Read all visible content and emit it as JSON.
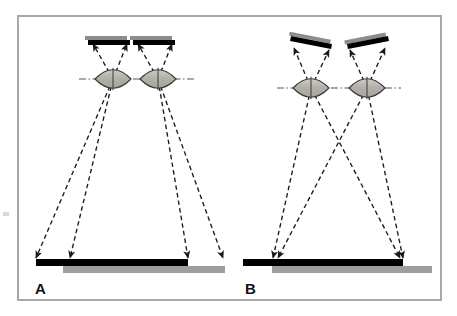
{
  "figure": {
    "background_color": "#ffffff",
    "frame": {
      "name": "figure-border",
      "color": "#a8a8a8",
      "x": 18,
      "y": 16,
      "width": 423,
      "height": 284,
      "stroke_width": 2
    },
    "edge_artifact": {
      "color": "#d9d9d9",
      "x": 3,
      "y": 212,
      "width": 6,
      "height": 4
    }
  },
  "colors": {
    "black": "#000000",
    "sensor_top_gray": "#8c8c8c",
    "object_gray": "#9e9e9e",
    "lens_fill": "#bdbab4",
    "lens_stroke": "#3a3a3a",
    "ray": "#1a1a1a",
    "axis": "#555555",
    "frame": "#a8a8a8"
  },
  "panels": [
    {
      "id": "A",
      "label": "A",
      "label_x": 35,
      "label_y": 294,
      "description": "Parallel (non-converged) sensor configuration with offset object bars",
      "sensors": [
        {
          "name": "sensor-a-left",
          "x1": 88,
          "y1": 40,
          "x2": 130,
          "y2": 40,
          "gray_offset_x": -3,
          "gray_offset_y": -4,
          "thickness": 5,
          "tilt_deg": 0
        },
        {
          "name": "sensor-a-right",
          "x1": 133,
          "y1": 40,
          "x2": 175,
          "y2": 40,
          "gray_offset_x": -3,
          "gray_offset_y": -4,
          "thickness": 5,
          "tilt_deg": 0
        }
      ],
      "lenses": [
        {
          "name": "lens-a-left",
          "cx": 113,
          "cy": 79,
          "rx": 18,
          "ry": 9
        },
        {
          "name": "lens-a-right",
          "cx": 158,
          "cy": 79,
          "rx": 18,
          "ry": 9
        }
      ],
      "optical_axis": {
        "name": "optical-axis-a",
        "x1": 79,
        "x2": 194,
        "y": 79
      },
      "objects": [
        {
          "name": "object-bar-a-black",
          "x": 36,
          "y": 259,
          "width": 152,
          "height": 7,
          "color": "#000000"
        },
        {
          "name": "object-bar-a-gray",
          "x": 63,
          "y": 266,
          "width": 162,
          "height": 7,
          "color": "#9e9e9e"
        }
      ],
      "rays": [
        {
          "name": "ray-a-1",
          "from_x": 113,
          "from_y": 79,
          "to_x": 36,
          "to_y": 258,
          "arrow": "end"
        },
        {
          "name": "ray-a-2",
          "from_x": 113,
          "from_y": 79,
          "to_x": 70,
          "to_y": 258,
          "arrow": "end"
        },
        {
          "name": "ray-a-3",
          "from_x": 113,
          "from_y": 79,
          "to_x": 93,
          "to_y": 44,
          "arrow": "end"
        },
        {
          "name": "ray-a-4",
          "from_x": 113,
          "from_y": 79,
          "to_x": 127,
          "to_y": 44,
          "arrow": "end"
        },
        {
          "name": "ray-a-5",
          "from_x": 158,
          "from_y": 79,
          "to_x": 188,
          "to_y": 258,
          "arrow": "end"
        },
        {
          "name": "ray-a-6",
          "from_x": 158,
          "from_y": 79,
          "to_x": 223,
          "to_y": 258,
          "arrow": "end"
        },
        {
          "name": "ray-a-7",
          "from_x": 158,
          "from_y": 79,
          "to_x": 138,
          "to_y": 44,
          "arrow": "end"
        },
        {
          "name": "ray-a-8",
          "from_x": 158,
          "from_y": 79,
          "to_x": 172,
          "to_y": 44,
          "arrow": "end"
        }
      ]
    },
    {
      "id": "B",
      "label": "B",
      "label_x": 245,
      "label_y": 294,
      "description": "Converged (tilted sensor) configuration with aligned object bars",
      "sensors": [
        {
          "name": "sensor-b-left",
          "x1": 291,
          "y1": 36,
          "x2": 332,
          "y2": 44,
          "gray_offset_x": -2,
          "gray_offset_y": -4,
          "thickness": 5,
          "tilt_deg": 11
        },
        {
          "name": "sensor-b-right",
          "x1": 347,
          "y1": 44,
          "x2": 388,
          "y2": 36,
          "gray_offset_x": -2,
          "gray_offset_y": -4,
          "thickness": 5,
          "tilt_deg": -11
        }
      ],
      "lenses": [
        {
          "name": "lens-b-left",
          "cx": 311,
          "cy": 88,
          "rx": 18,
          "ry": 9
        },
        {
          "name": "lens-b-right",
          "cx": 367,
          "cy": 88,
          "rx": 18,
          "ry": 9
        }
      ],
      "optical_axis": {
        "name": "optical-axis-b",
        "x1": 277,
        "x2": 401,
        "y": 88
      },
      "objects": [
        {
          "name": "object-bar-b-black",
          "x": 243,
          "y": 259,
          "width": 160,
          "height": 7,
          "color": "#000000"
        },
        {
          "name": "object-bar-b-gray",
          "x": 272,
          "y": 266,
          "width": 160,
          "height": 7,
          "color": "#9e9e9e"
        }
      ],
      "rays": [
        {
          "name": "ray-b-1",
          "from_x": 311,
          "from_y": 88,
          "to_x": 273,
          "to_y": 258,
          "arrow": "end"
        },
        {
          "name": "ray-b-2",
          "from_x": 311,
          "from_y": 88,
          "to_x": 400,
          "to_y": 258,
          "arrow": "end"
        },
        {
          "name": "ray-b-3",
          "from_x": 311,
          "from_y": 88,
          "to_x": 294,
          "to_y": 48,
          "arrow": "end"
        },
        {
          "name": "ray-b-4",
          "from_x": 311,
          "from_y": 88,
          "to_x": 329,
          "to_y": 50,
          "arrow": "end"
        },
        {
          "name": "ray-b-5",
          "from_x": 367,
          "from_y": 88,
          "to_x": 278,
          "to_y": 258,
          "arrow": "end"
        },
        {
          "name": "ray-b-6",
          "from_x": 367,
          "from_y": 88,
          "to_x": 403,
          "to_y": 258,
          "arrow": "end"
        },
        {
          "name": "ray-b-7",
          "from_x": 367,
          "from_y": 88,
          "to_x": 350,
          "to_y": 50,
          "arrow": "end"
        },
        {
          "name": "ray-b-8",
          "from_x": 367,
          "from_y": 88,
          "to_x": 385,
          "to_y": 48,
          "arrow": "end"
        }
      ]
    }
  ]
}
